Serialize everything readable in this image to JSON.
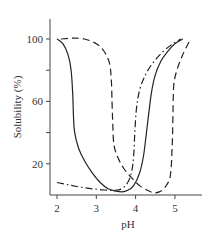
{
  "chart_data": {
    "type": "line",
    "title": "",
    "xlabel": "pH",
    "ylabel": "Solubility (%)",
    "xlim": [
      1.8,
      5.7
    ],
    "ylim": [
      0,
      115
    ],
    "x_ticks": [
      2,
      3,
      4,
      5
    ],
    "x_tick_labels": [
      "2",
      "3",
      "4",
      "5"
    ],
    "y_ticks": [
      20,
      40,
      60,
      80,
      100
    ],
    "y_tick_labels": [
      "20",
      "",
      "60",
      "",
      "100"
    ],
    "grid": false,
    "legend": null,
    "series": [
      {
        "name": "solid",
        "style": "solid",
        "points": [
          [
            2.0,
            100
          ],
          [
            2.15,
            97
          ],
          [
            2.28,
            90
          ],
          [
            2.36,
            80
          ],
          [
            2.4,
            65
          ],
          [
            2.42,
            50
          ],
          [
            2.45,
            40
          ],
          [
            2.55,
            30
          ],
          [
            2.7,
            22
          ],
          [
            2.9,
            14
          ],
          [
            3.1,
            8
          ],
          [
            3.3,
            4
          ],
          [
            3.5,
            2.5
          ],
          [
            3.65,
            2
          ],
          [
            3.8,
            3
          ],
          [
            3.95,
            6
          ],
          [
            4.1,
            14
          ],
          [
            4.2,
            25
          ],
          [
            4.3,
            45
          ],
          [
            4.4,
            65
          ],
          [
            4.5,
            77
          ],
          [
            4.65,
            86
          ],
          [
            4.85,
            93
          ],
          [
            5.0,
            97
          ],
          [
            5.2,
            100
          ]
        ]
      },
      {
        "name": "dashed",
        "style": "dashed",
        "points": [
          [
            2.1,
            100
          ],
          [
            2.4,
            100.5
          ],
          [
            2.7,
            100
          ],
          [
            3.0,
            97
          ],
          [
            3.2,
            92
          ],
          [
            3.33,
            85
          ],
          [
            3.38,
            75
          ],
          [
            3.4,
            60
          ],
          [
            3.42,
            45
          ],
          [
            3.45,
            32
          ],
          [
            3.55,
            24
          ],
          [
            3.7,
            17
          ],
          [
            3.9,
            11
          ],
          [
            4.1,
            6
          ],
          [
            4.3,
            3
          ],
          [
            4.45,
            1.5
          ],
          [
            4.6,
            2
          ],
          [
            4.75,
            5
          ],
          [
            4.88,
            12
          ],
          [
            4.93,
            30
          ],
          [
            4.95,
            50
          ],
          [
            4.97,
            70
          ],
          [
            5.05,
            80
          ],
          [
            5.2,
            90
          ],
          [
            5.4,
            100
          ]
        ]
      },
      {
        "name": "dash-dot",
        "style": "dashdot",
        "points": [
          [
            2.0,
            8
          ],
          [
            2.3,
            6.5
          ],
          [
            2.6,
            5
          ],
          [
            2.9,
            4
          ],
          [
            3.2,
            3.2
          ],
          [
            3.45,
            3
          ],
          [
            3.65,
            4
          ],
          [
            3.8,
            8
          ],
          [
            3.9,
            15
          ],
          [
            3.95,
            25
          ],
          [
            3.98,
            40
          ],
          [
            4.02,
            55
          ],
          [
            4.1,
            67
          ],
          [
            4.25,
            77
          ],
          [
            4.45,
            85
          ],
          [
            4.7,
            92
          ],
          [
            4.95,
            97
          ],
          [
            5.15,
            100
          ]
        ]
      }
    ]
  }
}
